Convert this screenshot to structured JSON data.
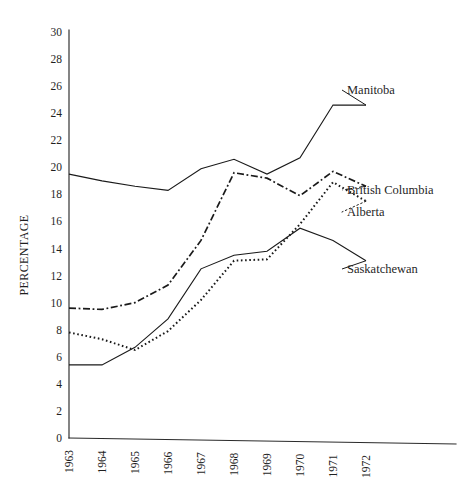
{
  "chart_data": {
    "type": "line",
    "title": "",
    "subtitle": "",
    "xlabel": "",
    "ylabel": "PERCENTAGE",
    "x": [
      1963,
      1964,
      1965,
      1966,
      1967,
      1968,
      1969,
      1970,
      1971,
      1972
    ],
    "categories": [
      "1963",
      "1964",
      "1965",
      "1966",
      "1967",
      "1968",
      "1969",
      "1970",
      "1971",
      "1972"
    ],
    "xlim": [
      1963,
      1972
    ],
    "ylim": [
      0,
      30
    ],
    "ytick_labels": [
      "0",
      "2",
      "4",
      "6",
      "8",
      "10",
      "12",
      "14",
      "16",
      "18",
      "20",
      "22",
      "24",
      "26",
      "28",
      "30"
    ],
    "ytick_values": [
      0,
      2,
      4,
      6,
      8,
      10,
      12,
      14,
      16,
      18,
      20,
      22,
      24,
      26,
      28,
      30
    ],
    "grid": false,
    "legend_position": "right-inline-labels",
    "series": [
      {
        "name": "Manitoba",
        "style": "solid",
        "color": "#1a1a1a",
        "label": "Manitoba",
        "values": [
          19.5,
          19.0,
          18.6,
          18.3,
          19.9,
          20.6,
          19.5,
          20.7,
          24.6,
          24.6
        ]
      },
      {
        "name": "British Columbia",
        "style": "dash-dot",
        "color": "#1a1a1a",
        "label": "British Columbia",
        "values": [
          9.6,
          9.5,
          10.0,
          11.3,
          14.6,
          19.6,
          19.2,
          17.9,
          19.7,
          18.6
        ]
      },
      {
        "name": "Alberta",
        "style": "dotted",
        "color": "#1a1a1a",
        "label": "Alberta",
        "values": [
          7.8,
          7.3,
          6.5,
          7.9,
          10.2,
          13.1,
          13.2,
          15.8,
          18.9,
          17.5
        ]
      },
      {
        "name": "Saskatchewan",
        "style": "solid",
        "color": "#1a1a1a",
        "label": "Saskatchewan",
        "values": [
          5.4,
          5.4,
          6.7,
          8.8,
          12.5,
          13.5,
          13.8,
          15.5,
          14.6,
          13.1
        ]
      }
    ],
    "annotations": [
      {
        "text": "Manitoba",
        "series": "Manitoba",
        "x_px": 347,
        "y_px": 94
      },
      {
        "text": "British Columbia",
        "series": "British Columbia",
        "x_px": 347,
        "y_px": 194
      },
      {
        "text": "Alberta",
        "series": "Alberta",
        "x_px": 347,
        "y_px": 216
      },
      {
        "text": "Saskatchewan",
        "series": "Saskatchewan",
        "x_px": 347,
        "y_px": 273
      }
    ]
  },
  "axis": {
    "y_title": "PERCENTAGE"
  },
  "colors": {
    "ink": "#1a1a1a",
    "axis": "#2b2b2b",
    "background": "#ffffff"
  }
}
